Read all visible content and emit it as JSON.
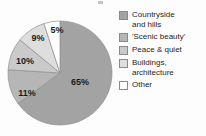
{
  "chart_data": {
    "type": "pie",
    "title": "",
    "categories": [
      "Countryside and hills",
      "'Scenic beauty'",
      "Peace & quiet",
      "Buildings, architecture",
      "Other"
    ],
    "values": [
      65,
      11,
      10,
      9,
      5
    ],
    "value_labels": [
      "65%",
      "11%",
      "10%",
      "9%",
      "5%"
    ],
    "colors": [
      "#a3a3a3",
      "#b6b6b6",
      "#cacaca",
      "#dedede",
      "#ffffff"
    ],
    "legend_position": "right",
    "grid": false,
    "units": "percent",
    "start_angle_deg": 0,
    "direction": "clockwise"
  },
  "legend": {
    "items": [
      {
        "label": "Countryside\nand hills",
        "color": "#a3a3a3",
        "swatch_name": "legend-swatch-countryside"
      },
      {
        "label": "'Scenic beauty'",
        "color": "#b6b6b6",
        "swatch_name": "legend-swatch-scenic-beauty"
      },
      {
        "label": "Peace & quiet",
        "color": "#cacaca",
        "swatch_name": "legend-swatch-peace-quiet"
      },
      {
        "label": "Buildings,\narchitecture",
        "color": "#dedede",
        "swatch_name": "legend-swatch-buildings"
      },
      {
        "label": "Other",
        "color": "#ffffff",
        "swatch_name": "legend-swatch-other"
      }
    ]
  },
  "pie": {
    "center_x": 60,
    "center_y": 73,
    "radius": 52,
    "labels": [
      {
        "text": "65%",
        "x": 80,
        "y": 85
      },
      {
        "text": "11%",
        "x": 27,
        "y": 96
      },
      {
        "text": "10%",
        "x": 25,
        "y": 64
      },
      {
        "text": "9%",
        "x": 38,
        "y": 41
      },
      {
        "text": "5%",
        "x": 57,
        "y": 33
      }
    ]
  }
}
